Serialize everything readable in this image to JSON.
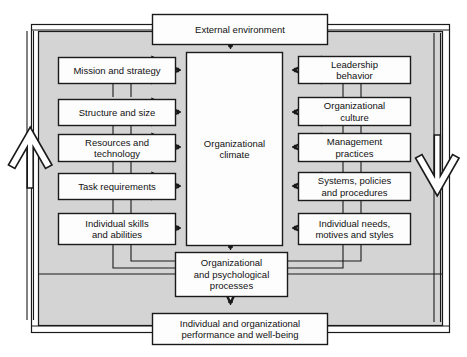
{
  "diagram": {
    "colors": {
      "panel_fill": "#d4d4d4",
      "box_fill": "#fdfdfd",
      "stroke": "#1a1a1a",
      "text": "#111111",
      "page_background": "#ffffff"
    },
    "external": {
      "label": "External environment"
    },
    "center": {
      "label": "Organizational\nclimate"
    },
    "left_column": [
      {
        "id": "mission-and-strategy",
        "label": "Mission and strategy"
      },
      {
        "id": "structure-and-size",
        "label": "Structure and size"
      },
      {
        "id": "resources-and-technology",
        "label": "Resources and\ntechnology"
      },
      {
        "id": "task-requirements",
        "label": "Task requirements"
      },
      {
        "id": "individual-skills-and-abilities",
        "label": "Individual skills\nand abilities"
      }
    ],
    "right_column": [
      {
        "id": "leadership-behavior",
        "label": "Leadership\nbehavior"
      },
      {
        "id": "organizational-culture",
        "label": "Organizational\nculture"
      },
      {
        "id": "management-practices",
        "label": "Management\npractices"
      },
      {
        "id": "systems-policies-and-procedures",
        "label": "Systems, policies\nand procedures"
      },
      {
        "id": "individual-needs-motives-and-styles",
        "label": "Individual needs,\nmotives and styles"
      }
    ],
    "processes": {
      "label": "Organizational\nand psychological\nprocesses"
    },
    "outcome": {
      "label": "Individual and organizational\nperformance and well-being"
    },
    "feedback_arrows": [
      {
        "id": "left-feedback-arrow-up",
        "direction": "up"
      },
      {
        "id": "right-feedback-arrow-down",
        "direction": "down"
      }
    ]
  }
}
